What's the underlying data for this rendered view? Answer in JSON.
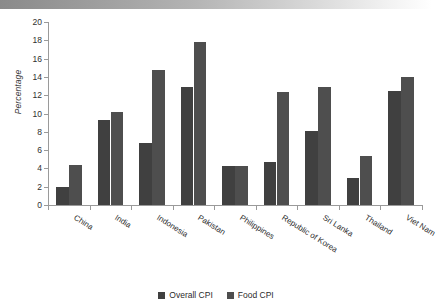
{
  "chart_data": {
    "type": "bar",
    "title": "",
    "xlabel": "",
    "ylabel": "Percentage",
    "ylim": [
      0,
      20
    ],
    "ytick_step": 2,
    "yticks": [
      0,
      2,
      4,
      6,
      8,
      10,
      12,
      14,
      16,
      18,
      20
    ],
    "grid": false,
    "legend_position": "bottom-center",
    "categories": [
      "China",
      "India",
      "Indonesia",
      "Pakistan",
      "Philippines",
      "Republic of Korea",
      "Sri Lanka",
      "Thailand",
      "Viet Nam"
    ],
    "series": [
      {
        "name": "Overall CPI",
        "color": "#404040",
        "values": [
          2.0,
          9.3,
          6.8,
          12.9,
          4.3,
          4.7,
          8.1,
          3.0,
          12.5
        ]
      },
      {
        "name": "Food CPI",
        "color": "#4e4e4e",
        "values": [
          4.4,
          10.2,
          14.8,
          17.8,
          4.3,
          12.3,
          12.9,
          5.4,
          14.0
        ]
      }
    ]
  }
}
